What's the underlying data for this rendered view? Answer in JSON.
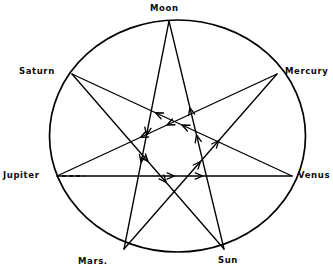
{
  "figure": {
    "title": "",
    "type": "heptagram-planetary-diagram",
    "background_color": "#ffffff",
    "stroke_color": "#000000"
  },
  "circle": {
    "cx": 177.5,
    "cy": 136,
    "rx": 128,
    "ry": 116,
    "stroke_width": 1.6
  },
  "nodes": [
    {
      "id": "moon",
      "label": "Moon",
      "x": 169,
      "y": 21,
      "angle_deg": 90,
      "label_anchor": "top"
    },
    {
      "id": "mercury",
      "label": "Mercury",
      "x": 277,
      "y": 74,
      "angle_deg": 38.57,
      "label_anchor": "right"
    },
    {
      "id": "venus",
      "label": "Venus",
      "x": 292,
      "y": 176,
      "angle_deg": -12.86,
      "label_anchor": "right"
    },
    {
      "id": "sun",
      "label": "Sun",
      "x": 224,
      "y": 249,
      "angle_deg": -64.29,
      "label_anchor": "bottom"
    },
    {
      "id": "mars",
      "label": "Mars.",
      "x": 124,
      "y": 249,
      "angle_deg": -115.71,
      "label_anchor": "bottom"
    },
    {
      "id": "jupiter",
      "label": "Jupiter",
      "x": 57,
      "y": 176,
      "angle_deg": -167.14,
      "label_anchor": "left"
    },
    {
      "id": "saturn",
      "label": "Saturn",
      "x": 72,
      "y": 74,
      "angle_deg": 141.43,
      "label_anchor": "left"
    }
  ],
  "edges": [
    {
      "from": "moon",
      "to": "mars",
      "arrow": "forward"
    },
    {
      "from": "mars",
      "to": "mercury",
      "arrow": "forward"
    },
    {
      "from": "mercury",
      "to": "jupiter",
      "arrow": "forward"
    },
    {
      "from": "jupiter",
      "to": "venus",
      "arrow": "forward"
    },
    {
      "from": "venus",
      "to": "saturn",
      "arrow": "forward"
    },
    {
      "from": "saturn",
      "to": "sun",
      "arrow": "forward"
    },
    {
      "from": "sun",
      "to": "moon",
      "arrow": "forward"
    }
  ],
  "dashed_marker": {
    "description": "short dashed segment just inside the Jupiter vertex",
    "x1": 62,
    "y1": 176,
    "x2": 84,
    "y2": 176
  }
}
